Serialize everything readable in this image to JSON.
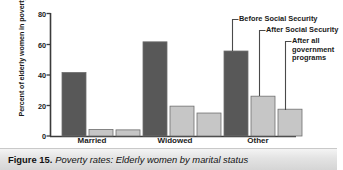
{
  "figure": {
    "caption_number": "Figure 15.",
    "caption_text": "Poverty rates: Elderly women by marital status"
  },
  "chart_data": {
    "type": "bar",
    "title": "Poverty rates: Elderly women by marital status",
    "xlabel": "",
    "ylabel": "Percent of elderly women in poverty",
    "ylim": [
      0,
      80
    ],
    "yticks": [
      0,
      20,
      40,
      60,
      80
    ],
    "ytick_labels": [
      "0",
      "20",
      "40",
      "60",
      "80"
    ],
    "grid": false,
    "legend_position": "annotations-right",
    "categories": [
      "Married",
      "Widowed",
      "Other"
    ],
    "series": [
      {
        "name": "Before Social Security",
        "color": "#585858",
        "values": [
          41.5,
          61.5,
          55.5
        ]
      },
      {
        "name": "After Social Security",
        "color": "#c6c6c6",
        "values": [
          4.3,
          19.5,
          26.0
        ]
      },
      {
        "name": "After all government programs",
        "color": "#c6c6c6",
        "values": [
          4.0,
          15.0,
          17.5
        ]
      }
    ],
    "annotations": [
      {
        "label": "Before Social Security",
        "target_category": "Other",
        "target_series": "Before Social Security"
      },
      {
        "label": "After Social Security",
        "target_category": "Other",
        "target_series": "After Social Security"
      },
      {
        "label": "After all government programs",
        "target_category": "Other",
        "target_series": "After all government programs"
      }
    ]
  },
  "axis": {
    "tick_0": "0",
    "tick_20": "20",
    "tick_40": "40",
    "tick_60": "60",
    "tick_80": "80",
    "y_title": "Percent of elderly women in poverty"
  },
  "categories": {
    "married": "Married",
    "widowed": "Widowed",
    "other": "Other"
  },
  "annotations": {
    "before": "Before Social Security",
    "after_ss": "After Social Security",
    "after_all": "After all government programs"
  }
}
